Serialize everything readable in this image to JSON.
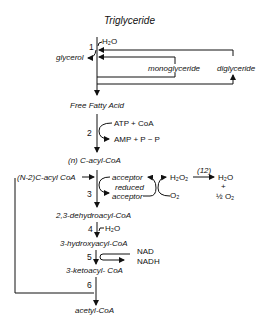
{
  "title": "Triglyceride",
  "steps": {
    "s1": "1",
    "s2": "2",
    "s3": "3",
    "s4": "4",
    "s5": "5",
    "s6": "6",
    "s12": "(12)"
  },
  "compounds": {
    "h2o_1": "H₂O",
    "glycerol": "glycerol",
    "monoglyceride": "monoglyceride",
    "diglyceride": "diglyceride",
    "free_fatty_acid": "Free Fatty Acid",
    "atp_coa": "ATP + CoA",
    "amp_ppi": "AMP + P ~ P",
    "n_acyl_coa": "(n) C-acyl-CoA",
    "n2_acyl_coa": "(N-2)C-acyl CoA",
    "acceptor": "acceptor",
    "reduced": "reduced",
    "acceptor2": "acceptor",
    "h2o2": "H₂O₂",
    "o2": "O₂",
    "h2o_2": "H₂O",
    "plus": "+",
    "half_o2": "½ O₂",
    "dehydroacyl": "2,3-dehydroacyl-CoA",
    "h2o_3": "H₂O",
    "hydroxyacyl": "3-hydroxyacyl-CoA",
    "nad": "NAD",
    "nadh": "NADH",
    "ketoacyl": "3-ketoacyl- CoA",
    "acetyl_coa": "acetyl-CoA"
  }
}
